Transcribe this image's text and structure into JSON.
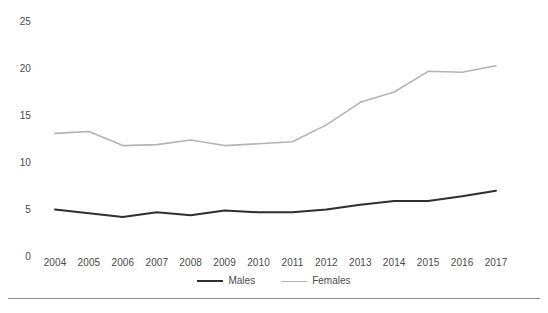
{
  "chart_data": {
    "type": "line",
    "title": "",
    "subtitle": "",
    "xlabel": "",
    "ylabel": "",
    "x": [
      2004,
      2005,
      2006,
      2007,
      2008,
      2009,
      2010,
      2011,
      2012,
      2013,
      2014,
      2015,
      2016,
      2017
    ],
    "categories": [
      "2004",
      "2005",
      "2006",
      "2007",
      "2008",
      "2009",
      "2010",
      "2011",
      "2012",
      "2013",
      "2014",
      "2015",
      "2016",
      "2017"
    ],
    "series": [
      {
        "name": "Males",
        "color": "#2f2f2f",
        "values": [
          5.0,
          4.6,
          4.2,
          4.7,
          4.4,
          4.9,
          4.7,
          4.7,
          5.0,
          5.5,
          5.9,
          5.9,
          6.4,
          7.0
        ]
      },
      {
        "name": "Females",
        "color": "#b4b4b4",
        "values": [
          13.1,
          13.3,
          11.8,
          11.9,
          12.4,
          11.8,
          12.0,
          12.2,
          14.0,
          16.4,
          17.5,
          19.7,
          19.6,
          20.3
        ]
      }
    ],
    "ylim": [
      0,
      25
    ],
    "yticks": [
      0,
      5,
      10,
      15,
      20,
      25
    ],
    "ytick_labels": [
      "0",
      "5",
      "10",
      "15",
      "20",
      "25"
    ],
    "xlim": [
      2004,
      2017
    ],
    "grid": false,
    "legend_position": "bottom",
    "legend_entries": [
      "Males",
      "Females"
    ]
  },
  "axes": {
    "y_ticks": [
      {
        "label": "25",
        "value": 25
      },
      {
        "label": "20",
        "value": 20
      },
      {
        "label": "15",
        "value": 15
      },
      {
        "label": "10",
        "value": 10
      },
      {
        "label": "5",
        "value": 5
      },
      {
        "label": "0",
        "value": 0
      }
    ],
    "x_ticks": [
      {
        "label": "2004"
      },
      {
        "label": "2005"
      },
      {
        "label": "2006"
      },
      {
        "label": "2007"
      },
      {
        "label": "2008"
      },
      {
        "label": "2009"
      },
      {
        "label": "2010"
      },
      {
        "label": "2011"
      },
      {
        "label": "2012"
      },
      {
        "label": "2013"
      },
      {
        "label": "2014"
      },
      {
        "label": "2015"
      },
      {
        "label": "2016"
      },
      {
        "label": "2017"
      }
    ]
  },
  "legend": {
    "items": [
      {
        "label": "Males",
        "style": "males"
      },
      {
        "label": "Females",
        "style": "females"
      }
    ]
  },
  "colors": {
    "males_line": "#2f2f2f",
    "females_line": "#b4b4b4",
    "tick_text": "#4a4a4a",
    "rule": "#8d8d8d",
    "background": "#ffffff"
  }
}
